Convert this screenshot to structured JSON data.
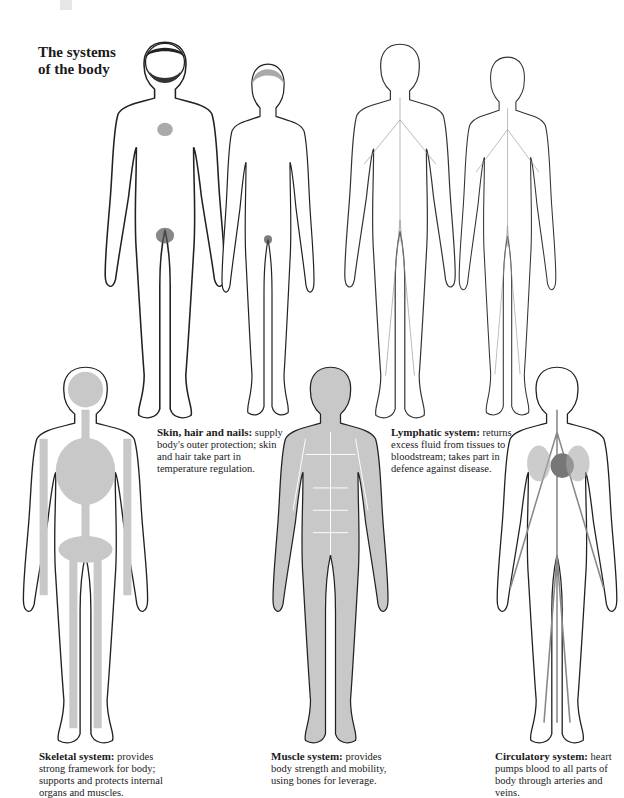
{
  "page": {
    "title_line1": "The systems",
    "title_line2": "of the body"
  },
  "captions": [
    {
      "heading": "Skin, hair and nails:",
      "text": "supply body's outer protection; skin and hair take part in temperature regulation."
    },
    {
      "heading": "Lymphatic system:",
      "text": "returns excess fluid from tissues to bloodstream; takes part in defence against disease."
    },
    {
      "heading": "Skeletal system:",
      "text": "provides strong framework for body; supports and protects internal organs and muscles."
    },
    {
      "heading": "Muscle system:",
      "text": "provides body strength and mobility, using bones for leverage."
    },
    {
      "heading": "Circulatory system:",
      "text": "heart pumps blood to all parts of body through arteries and veins."
    }
  ],
  "figures": [
    {
      "name": "male-skin-figure"
    },
    {
      "name": "female-skin-figure"
    },
    {
      "name": "lymphatic-male-figure"
    },
    {
      "name": "lymphatic-female-figure"
    },
    {
      "name": "skeletal-figure"
    },
    {
      "name": "muscle-figure"
    },
    {
      "name": "circulatory-figure"
    }
  ],
  "colors": {
    "fill_gray": "#c8c8c8",
    "outline": "#222222",
    "heart": "#777777"
  }
}
